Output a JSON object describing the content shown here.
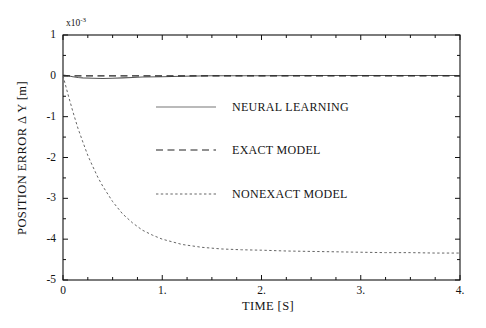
{
  "chart_data": {
    "type": "line",
    "title": "",
    "xlabel": "TIME [S]",
    "ylabel": "POSITION ERROR  Δ Y [m]",
    "y_exponent_label": "x10",
    "y_exponent_power": "-3",
    "y_scale_note": "axis values are in units of 1e-3 m",
    "xlim": [
      0,
      4
    ],
    "ylim": [
      -5,
      1
    ],
    "xticks": [
      0,
      1,
      2,
      3,
      4
    ],
    "xtick_labels": [
      "0",
      "1.",
      "2.",
      "3.",
      "4."
    ],
    "yticks": [
      1,
      0,
      -1,
      -2,
      -3,
      -4,
      -5
    ],
    "ytick_labels": [
      "1",
      "0",
      "-1",
      "-2",
      "-3",
      "-4",
      "-5"
    ],
    "x_minor_tick_interval": 0.25,
    "y_minor_tick_interval": 0.5,
    "grid": false,
    "legend_position": "center",
    "series": [
      {
        "name": "NEURAL LEARNING",
        "style": "solid",
        "color": "#555555",
        "x": [
          0.0,
          0.05,
          0.1,
          0.15,
          0.2,
          0.3,
          0.4,
          0.5,
          0.6,
          0.7,
          0.8,
          1.0,
          1.2,
          1.5,
          2.0,
          2.5,
          3.0,
          3.5,
          4.0
        ],
        "y": [
          0.02,
          0.0,
          -0.02,
          -0.04,
          -0.05,
          -0.06,
          -0.065,
          -0.06,
          -0.05,
          -0.04,
          -0.03,
          -0.02,
          -0.01,
          0.0,
          0.0,
          0.01,
          0.01,
          0.01,
          0.01
        ]
      },
      {
        "name": "EXACT MODEL",
        "style": "dashed",
        "color": "#222222",
        "x": [
          0.0,
          0.5,
          1.0,
          1.5,
          2.0,
          2.5,
          3.0,
          3.5,
          4.0
        ],
        "y": [
          0.0,
          0.0,
          0.0,
          0.0,
          0.0,
          0.0,
          0.0,
          0.0,
          0.0
        ]
      },
      {
        "name": "NONEXACT MODEL",
        "style": "dotted",
        "color": "#666666",
        "x": [
          0.0,
          0.05,
          0.1,
          0.15,
          0.2,
          0.25,
          0.3,
          0.35,
          0.4,
          0.5,
          0.6,
          0.7,
          0.8,
          0.9,
          1.0,
          1.2,
          1.4,
          1.6,
          1.8,
          2.0,
          2.25,
          2.5,
          2.75,
          3.0,
          3.25,
          3.5,
          3.75,
          4.0
        ],
        "y": [
          0.0,
          -0.45,
          -0.88,
          -1.28,
          -1.62,
          -1.95,
          -2.22,
          -2.48,
          -2.7,
          -3.08,
          -3.38,
          -3.6,
          -3.78,
          -3.9,
          -4.0,
          -4.13,
          -4.2,
          -4.24,
          -4.26,
          -4.27,
          -4.29,
          -4.3,
          -4.31,
          -4.32,
          -4.33,
          -4.33,
          -4.34,
          -4.34
        ]
      }
    ],
    "legend": [
      {
        "label": "NEURAL LEARNING",
        "style": "solid"
      },
      {
        "label": "EXACT MODEL",
        "style": "dashed"
      },
      {
        "label": "NONEXACT MODEL",
        "style": "dotted"
      }
    ]
  }
}
